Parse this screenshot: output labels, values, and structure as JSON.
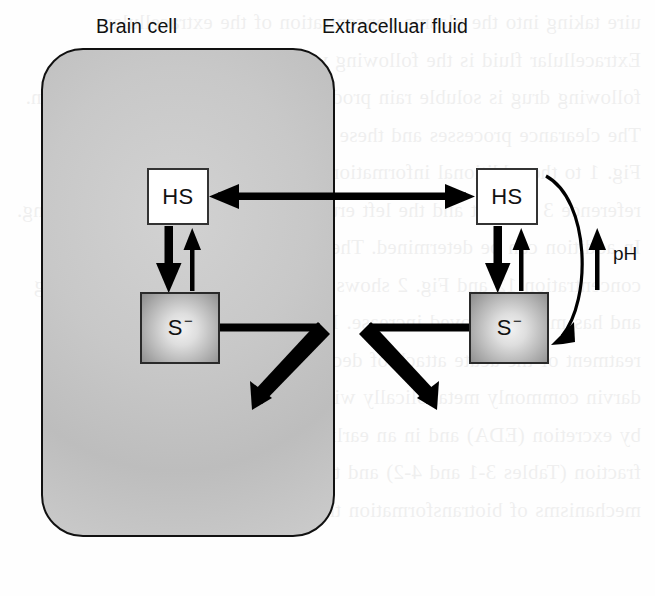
{
  "figure": {
    "title_left": "Brain cell",
    "title_right": "Extracelluar fluid",
    "ph_label": "pH",
    "species_protonated": "HS",
    "species_ionized": "S",
    "species_ionized_charge": "−",
    "bleed_text": "uire taking into the plasma concentration of the extracellular Extracellular fluid is the following volume of distribution for the following drug is soluble rain produces what is unbound in the brain. The clearance processes and these were used to build in the brain. Fig. 1 to the additional information of the most useful given in reference 3 is eight and the left erum drug concentration is increasing. In addition can be determined. The results in reference 3 also concentration 12 and Fig. 2 shows the results of processes occurring and has much improved increase. In the latter setting speed in reatment of the acute attack of decreased ammonium chloride to darvin commonly metabolically with the same in the in the nervous by excretion (EDA) and in an earlier paper by the body the two fraction (Tables 3-1 and 4-2) and the same in the blood. In basic mechanisms of biotransformation through passage"
  },
  "colors": {
    "cell_fill_light": "#d2d2d2",
    "cell_fill_dark": "#bdbdbd",
    "outline": "#111111",
    "hs_box_fill": "#ffffff",
    "s_box_center": "#f2f2f2",
    "s_box_edge": "#8d8d8d"
  },
  "arrows": [
    {
      "name": "hs-transmembrane-bidirectional",
      "from": "HS (brain cell)",
      "to": "HS (extracellular fluid)",
      "direction": "bidirectional",
      "weight": "thick"
    },
    {
      "name": "hs-to-s-intracellular",
      "from": "HS (brain cell)",
      "to": "S− (brain cell)",
      "direction": "down",
      "weight": "thick"
    },
    {
      "name": "s-to-hs-intracellular",
      "from": "S− (brain cell)",
      "to": "HS (brain cell)",
      "direction": "up",
      "weight": "thin"
    },
    {
      "name": "hs-to-s-extracellular",
      "from": "HS (extracellular fluid)",
      "to": "S− (extracellular fluid)",
      "direction": "down",
      "weight": "thick"
    },
    {
      "name": "s-to-hs-extracellular",
      "from": "S− (extracellular fluid)",
      "to": "HS (extracellular fluid)",
      "direction": "up",
      "weight": "thin"
    },
    {
      "name": "s-intracellular-elimination",
      "from": "S− (brain cell)",
      "to": "down-left",
      "direction": "out",
      "weight": "thick"
    },
    {
      "name": "s-extracellular-elimination",
      "from": "S− (extracellular fluid)",
      "to": "down-right",
      "direction": "out",
      "weight": "thick"
    },
    {
      "name": "ph-curved-arrow",
      "from": "HS (extracellular fluid)",
      "to": "S− (extracellular fluid)",
      "direction": "curved-down",
      "weight": "medium"
    },
    {
      "name": "ph-increase-arrow",
      "direction": "up",
      "weight": "thin",
      "label": "pH"
    }
  ]
}
